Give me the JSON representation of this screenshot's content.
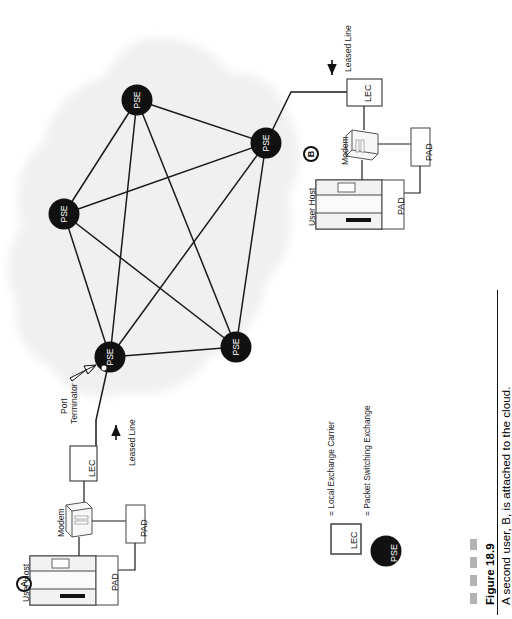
{
  "figure": {
    "number": "Figure 18.9",
    "caption": "A second user, B, is attached to the cloud.",
    "dash_count": 4,
    "dash_color": "#b3b3b3",
    "rule_color": "#111111"
  },
  "cloud": {
    "name": "packet switching network cloud",
    "fill": "#f0f0f0"
  },
  "nodes": [
    {
      "id": "pse-top",
      "label": "PSE",
      "cx": 137,
      "cy": 100,
      "r": 15.5
    },
    {
      "id": "pse-right",
      "label": "PSE",
      "cx": 266,
      "cy": 143,
      "r": 15.5
    },
    {
      "id": "pse-left",
      "label": "PSE",
      "cx": 64,
      "cy": 214,
      "r": 15.5
    },
    {
      "id": "pse-bottom-left",
      "label": "PSE",
      "cx": 110,
      "cy": 357,
      "r": 15.5
    },
    {
      "id": "pse-bottom-right",
      "label": "PSE",
      "cx": 236,
      "cy": 347,
      "r": 15.5
    }
  ],
  "links": [
    [
      "pse-top",
      "pse-right"
    ],
    [
      "pse-top",
      "pse-left"
    ],
    [
      "pse-top",
      "pse-bottom-left"
    ],
    [
      "pse-top",
      "pse-bottom-right"
    ],
    [
      "pse-right",
      "pse-left"
    ],
    [
      "pse-right",
      "pse-bottom-left"
    ],
    [
      "pse-right",
      "pse-bottom-right"
    ],
    [
      "pse-left",
      "pse-bottom-left"
    ],
    [
      "pse-left",
      "pse-bottom-right"
    ],
    [
      "pse-bottom-left",
      "pse-bottom-right"
    ]
  ],
  "annotations": {
    "port_terminator": "Port\nTerminator",
    "port_terminator_line1": "Port",
    "port_terminator_line2": "Terminator",
    "leased_line_left": "Leased Line",
    "leased_line_right": "Leased Line"
  },
  "user_a": {
    "marker": "A",
    "host_label": "User Host",
    "modem_label": "Modem",
    "pad_label_1": "PAD",
    "pad_label_2": "PAD",
    "lec_label": "LEC"
  },
  "user_b": {
    "marker": "B",
    "host_label": "User Host",
    "modem_label": "Modem",
    "pad_label_1": "PAD",
    "pad_label_2": "PAD",
    "lec_label": "LEC"
  },
  "legend": {
    "items": [
      {
        "symbol": "LEC",
        "shape": "square",
        "equals": "=",
        "text": "Local Exchange Carrier"
      },
      {
        "symbol": "PSE",
        "shape": "circle",
        "equals": "=",
        "text": "Packet Switching Exchange"
      }
    ],
    "lec_full": "= Local Exchange Carrier",
    "pse_full": "= Packet Switching Exchange"
  },
  "colors": {
    "node_fill": "#111111",
    "node_text": "#ffffff",
    "line": "#1a1a1a",
    "cloud": "#f0f0f0",
    "device_fill": "#ffffff",
    "device_stroke": "#555555"
  }
}
